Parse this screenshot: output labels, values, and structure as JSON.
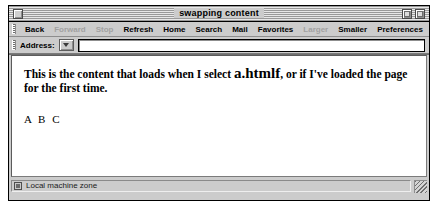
{
  "window": {
    "title": "swapping content",
    "close_box": "close-box",
    "zoom_box": "zoom-box",
    "collapse_box": "collapse-box"
  },
  "toolbar": {
    "grip": "toolbar-drag-grip",
    "buttons": [
      {
        "label": "Back",
        "enabled": true
      },
      {
        "label": "Forward",
        "enabled": false
      },
      {
        "label": "Stop",
        "enabled": false
      },
      {
        "label": "Refresh",
        "enabled": true
      },
      {
        "label": "Home",
        "enabled": true
      },
      {
        "label": "Search",
        "enabled": true
      },
      {
        "label": "Mail",
        "enabled": true
      },
      {
        "label": "Favorites",
        "enabled": true
      },
      {
        "label": "Larger",
        "enabled": false
      },
      {
        "label": "Smaller",
        "enabled": true
      },
      {
        "label": "Preferences",
        "enabled": true
      }
    ]
  },
  "address_bar": {
    "label": "Address:",
    "dropdown_icon": "chevron-down-icon",
    "value": "",
    "placeholder": ""
  },
  "content": {
    "paragraph_before": "This is the content that loads when I select ",
    "paragraph_emphasis": "a.htmlf",
    "paragraph_after": ", or if I've loaded the page for the first time.",
    "letters_line": "A B C"
  },
  "statusbar": {
    "zone_icon": "security-zone-icon",
    "zone_text": "Local machine zone",
    "resize_grip": "resize-grip"
  }
}
